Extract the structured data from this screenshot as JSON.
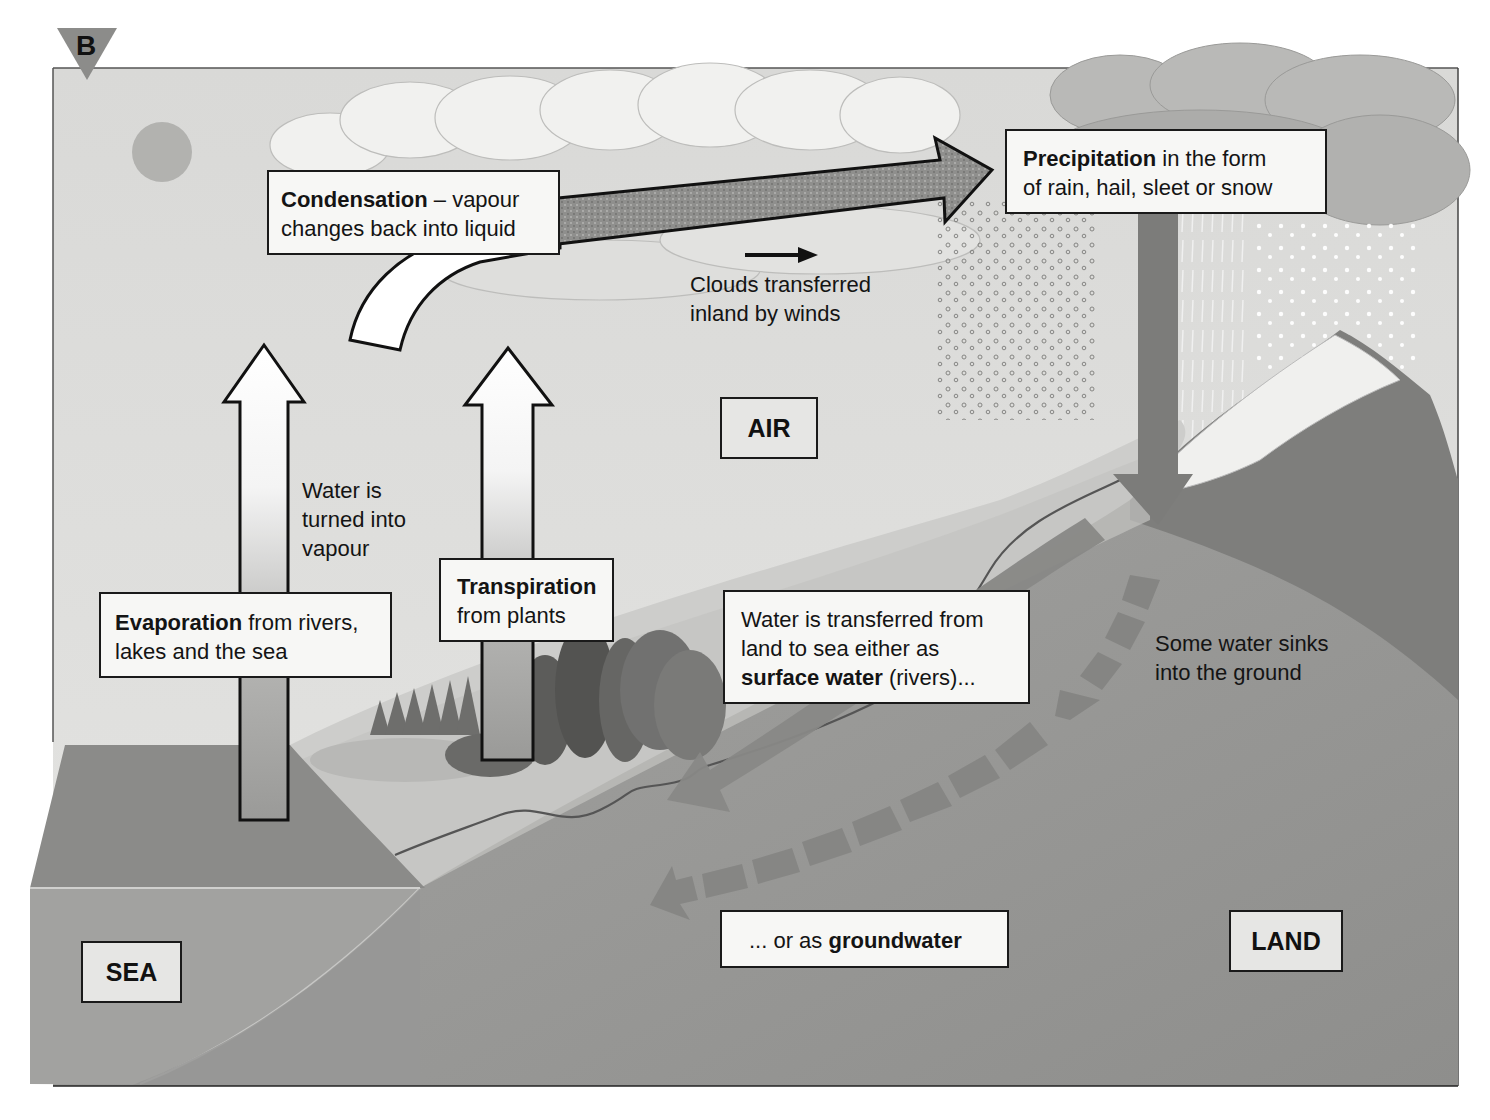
{
  "figure": {
    "badge": "B",
    "colors": {
      "sky": "#dcdcda",
      "cloud": "#efefed",
      "sea_top": "#8e8e8c",
      "sea_side": "#a3a3a1",
      "land": "#989896",
      "coast": "#cfcfcd",
      "arrow_dark": "#7a7a78",
      "arrow_flow": "#8c8c8a",
      "box_bg": "#f7f7f5",
      "region_bg": "#e6e6e4",
      "outline": "#1a1a1a"
    }
  },
  "regions": {
    "air": "AIR",
    "sea": "SEA",
    "land": "LAND"
  },
  "labels": {
    "condensation": {
      "term": "Condensation",
      "rest": " – vapour",
      "line2": "changes back into liquid"
    },
    "precipitation": {
      "term": "Precipitation",
      "rest": " in the form",
      "line2": "of rain, hail, sleet or snow"
    },
    "clouds_wind": {
      "line1": "Clouds transferred",
      "line2": "inland by winds"
    },
    "vapour_note": {
      "line1": "Water is",
      "line2": "turned into",
      "line3": "vapour"
    },
    "evaporation": {
      "term": "Evaporation",
      "rest": " from rivers,",
      "line2": "lakes and the sea"
    },
    "transpiration": {
      "term": "Transpiration",
      "line2": "from plants"
    },
    "surface_water": {
      "line1": "Water is transferred from",
      "line2": "land to sea either as",
      "term": "surface water",
      "rest": " (rivers)..."
    },
    "infiltration": {
      "line1": "Some water sinks",
      "line2": "into the ground"
    },
    "groundwater": {
      "prefix": "... or as ",
      "term": "groundwater"
    }
  },
  "arrows": [
    {
      "name": "evaporation",
      "direction": "up",
      "style": "gradient-outline"
    },
    {
      "name": "transpiration",
      "direction": "up",
      "style": "gradient-outline"
    },
    {
      "name": "condensation-curve",
      "direction": "up-right",
      "style": "white-outline"
    },
    {
      "name": "cloud-transport",
      "direction": "right",
      "style": "stippled-outline"
    },
    {
      "name": "wind",
      "direction": "right",
      "style": "black-small"
    },
    {
      "name": "precipitation",
      "direction": "down",
      "style": "solid-grey"
    },
    {
      "name": "surface-runoff",
      "direction": "down-left",
      "style": "solid-grey"
    },
    {
      "name": "infiltration",
      "direction": "down",
      "style": "dashed-grey"
    },
    {
      "name": "groundwater-flow",
      "direction": "left",
      "style": "dashed-grey"
    }
  ]
}
